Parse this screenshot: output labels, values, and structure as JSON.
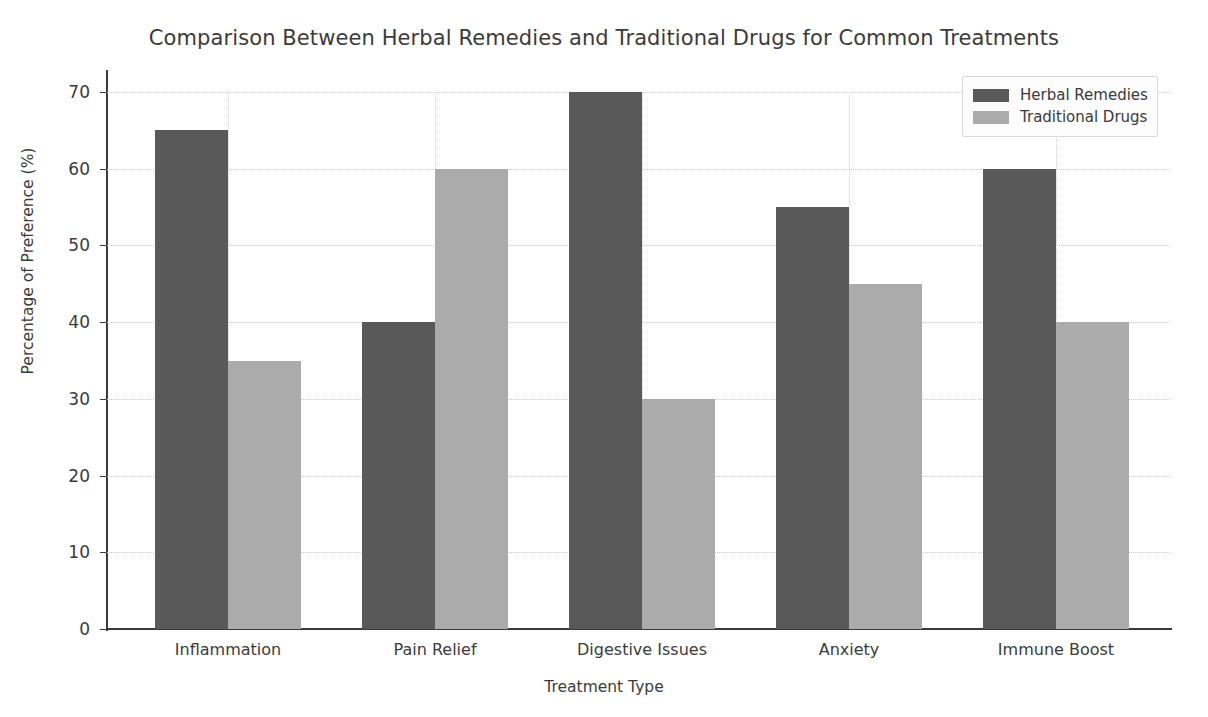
{
  "chart_data": {
    "type": "bar",
    "title": "Comparison Between Herbal Remedies and Traditional Drugs for Common Treatments",
    "xlabel": "Treatment Type",
    "ylabel": "Percentage of Preference (%)",
    "categories": [
      "Inflammation",
      "Pain Relief",
      "Digestive Issues",
      "Anxiety",
      "Immune Boost"
    ],
    "series": [
      {
        "name": "Herbal Remedies",
        "color": "#595959",
        "values": [
          65,
          40,
          70,
          55,
          60
        ]
      },
      {
        "name": "Traditional Drugs",
        "color": "#ababab",
        "values": [
          35,
          60,
          30,
          45,
          40
        ]
      }
    ],
    "ylim": [
      0,
      72
    ],
    "yticks": [
      0,
      10,
      20,
      30,
      40,
      50,
      60,
      70
    ],
    "ytick_labels": [
      "0",
      "10",
      "20",
      "30",
      "40",
      "50",
      "60",
      "70"
    ],
    "grid": true,
    "grid_axis": "both",
    "grid_style": "dotted",
    "legend_position": "upper right",
    "legend_entries": [
      "Herbal Remedies",
      "Traditional Drugs"
    ],
    "bar_group_count": 5,
    "bars_per_group": 2
  }
}
